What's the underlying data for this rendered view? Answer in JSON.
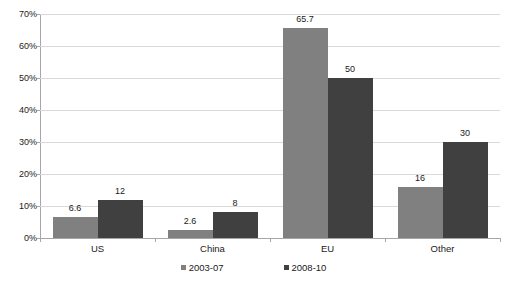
{
  "chart_data": {
    "type": "bar",
    "title": "",
    "subtitle": "",
    "xlabel": "",
    "ylabel": "",
    "categories": [
      "US",
      "China",
      "EU",
      "Other"
    ],
    "series": [
      {
        "name": "2003-07",
        "color": "#808080",
        "values": [
          6.6,
          2.6,
          65.7,
          16
        ],
        "labels": [
          "6.6",
          "2.6",
          "65.7",
          "16"
        ]
      },
      {
        "name": "2008-10",
        "color": "#404040",
        "values": [
          12,
          8,
          50,
          30
        ],
        "labels": [
          "12",
          "8",
          "50",
          "30"
        ]
      }
    ],
    "ylim": [
      0,
      70
    ],
    "ytick_values": [
      0,
      10,
      20,
      30,
      40,
      50,
      60,
      70
    ],
    "ytick_labels": [
      "0%",
      "10%",
      "20%",
      "30%",
      "40%",
      "50%",
      "60%",
      "70%"
    ],
    "grid": true,
    "legend_position": "bottom",
    "value_labels_shown": true,
    "colors": {
      "series_2003_07": "#808080",
      "series_2008_10": "#404040",
      "gridline": "#d9d9d9",
      "axis": "#a6a6a6",
      "text": "#1a1a1a",
      "background": "#ffffff"
    }
  }
}
